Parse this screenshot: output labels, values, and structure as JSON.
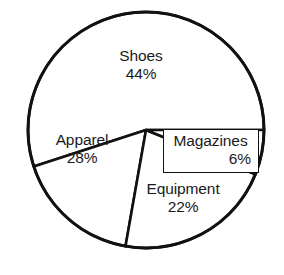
{
  "chart_data": {
    "type": "pie",
    "title": "",
    "subtitle": "",
    "xlabel": "",
    "ylabel": "",
    "legend": "none",
    "grid": false,
    "units": "percent",
    "categories": [
      "Shoes",
      "Apparel",
      "Equipment",
      "Magazines"
    ],
    "values": [
      44,
      28,
      22,
      6
    ],
    "slices": [
      {
        "label": "Shoes",
        "value": 44,
        "value_text": "44%",
        "start_angle_deg": 252,
        "end_angle_deg": 450,
        "fill": "#ffffff",
        "stroke": "#111111"
      },
      {
        "label": "Magazines",
        "value": 6,
        "value_text": "6%",
        "start_angle_deg": 90,
        "end_angle_deg": 112,
        "fill": "#ffffff",
        "stroke": "#111111"
      },
      {
        "label": "Equipment",
        "value": 22,
        "value_text": "22%",
        "start_angle_deg": 112,
        "end_angle_deg": 190,
        "fill": "#ffffff",
        "stroke": "#111111"
      },
      {
        "label": "Apparel",
        "value": 28,
        "value_text": "28%",
        "start_angle_deg": 190,
        "end_angle_deg": 252,
        "fill": "#ffffff",
        "stroke": "#111111"
      }
    ],
    "geometry": {
      "center_x": 146,
      "center_y": 130,
      "radius": 118
    },
    "colors": {
      "slice_fill": "#ffffff",
      "outline": "#111111",
      "text": "#1a1a1a",
      "background": "#ffffff"
    }
  }
}
